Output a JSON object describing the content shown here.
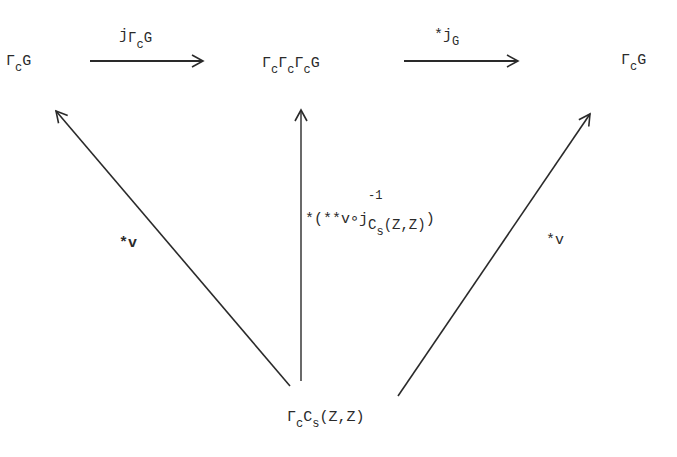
{
  "diagram": {
    "nodes": {
      "left": {
        "base": "Γ",
        "sub": "c",
        "tail": "G"
      },
      "middle": {
        "p1": "Γ",
        "s1": "c",
        "p2": "Γ",
        "s2": "c",
        "p3": "Γ",
        "s3": "c",
        "tail": "G"
      },
      "right": {
        "base": "Γ",
        "sub": "c",
        "tail": "G"
      },
      "bottom": {
        "base": "Γ",
        "sub": "c",
        "mid": "C",
        "sub2": "s",
        "tail": "(Z,Z)"
      }
    },
    "edges": {
      "top_left": {
        "from": "left",
        "to": "middle",
        "label_main": "j",
        "label_sub_base": "Γ",
        "label_sub_sub": "c",
        "label_sub_tail": "G"
      },
      "top_right": {
        "from": "middle",
        "to": "right",
        "label_star": "*",
        "label_main": "j",
        "label_sub": "G"
      },
      "bottom_left": {
        "from": "bottom",
        "to": "left",
        "label": "*v"
      },
      "bottom_mid": {
        "from": "bottom",
        "to": "middle",
        "label_prefix": "*(**v∘j",
        "label_sup": "-1",
        "label_sub_base": "C",
        "label_sub_sub": "s",
        "label_sub_tail": "(Z,Z)",
        "label_suffix": ")"
      },
      "bottom_right": {
        "from": "bottom",
        "to": "right",
        "label": "*v"
      }
    },
    "stroke_color": "#2a2a2a"
  }
}
